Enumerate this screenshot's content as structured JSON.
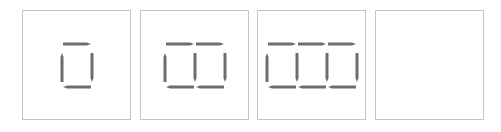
{
  "puzzle": {
    "description": "Matchstick sequence pattern",
    "panels": [
      {
        "index": 1,
        "squares": 1,
        "empty": false
      },
      {
        "index": 2,
        "squares": 2,
        "empty": false
      },
      {
        "index": 3,
        "squares": 3,
        "empty": false
      },
      {
        "index": 4,
        "squares": 0,
        "empty": true
      }
    ],
    "colors": {
      "border": "#c4c4c4",
      "stick": "#6e6e6e",
      "stick_tip": "#8a8a8a"
    }
  }
}
